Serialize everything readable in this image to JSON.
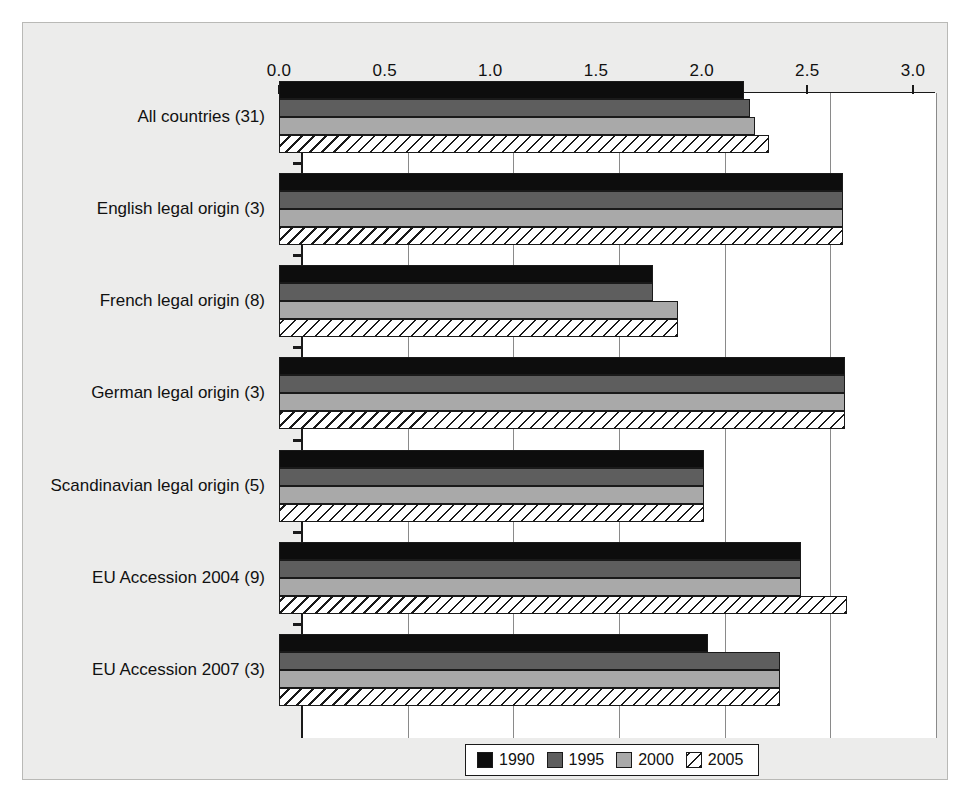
{
  "chart_data": {
    "type": "bar",
    "orientation": "horizontal",
    "title": "",
    "subtitle": "",
    "xlabel": "",
    "ylabel": "",
    "xlim": [
      0.0,
      3.0
    ],
    "xticks": [
      "0.0",
      "0.5",
      "1.0",
      "1.5",
      "2.0",
      "2.5",
      "3.0"
    ],
    "xtick_values": [
      0.0,
      0.5,
      1.0,
      1.5,
      2.0,
      2.5,
      3.0
    ],
    "grid": true,
    "grid_axis": "x",
    "axis_position": "top",
    "legend_position": "bottom-center",
    "categories": [
      "All countries (31)",
      "English legal origin (3)",
      "French legal origin (8)",
      "German legal origin (3)",
      "Scandinavian legal origin (5)",
      "EU Accession 2004 (9)",
      "EU Accession 2007 (3)"
    ],
    "series": [
      {
        "name": "1990",
        "color": "#0d0d0d",
        "pattern": "solid",
        "values": [
          2.2,
          2.67,
          1.77,
          2.68,
          2.01,
          2.47,
          2.03
        ]
      },
      {
        "name": "1995",
        "color": "#5e5e5e",
        "pattern": "solid",
        "values": [
          2.23,
          2.67,
          1.77,
          2.68,
          2.01,
          2.47,
          2.37
        ]
      },
      {
        "name": "2000",
        "color": "#a9a9a9",
        "pattern": "solid",
        "values": [
          2.25,
          2.67,
          1.89,
          2.68,
          2.01,
          2.47,
          2.37
        ]
      },
      {
        "name": "2005",
        "color": "#ffffff",
        "pattern": "diagonal-hatch",
        "values": [
          2.32,
          2.67,
          1.89,
          2.68,
          2.01,
          2.69,
          2.37
        ]
      }
    ]
  },
  "legend": {
    "entries": [
      {
        "label": "1990"
      },
      {
        "label": "1995"
      },
      {
        "label": "2000"
      },
      {
        "label": "2005"
      }
    ]
  },
  "colors": {
    "panel_background": "#ececeb",
    "plot_background": "#ffffff",
    "axis": "#1a1a1a",
    "gridline": "#8a8a8a"
  }
}
